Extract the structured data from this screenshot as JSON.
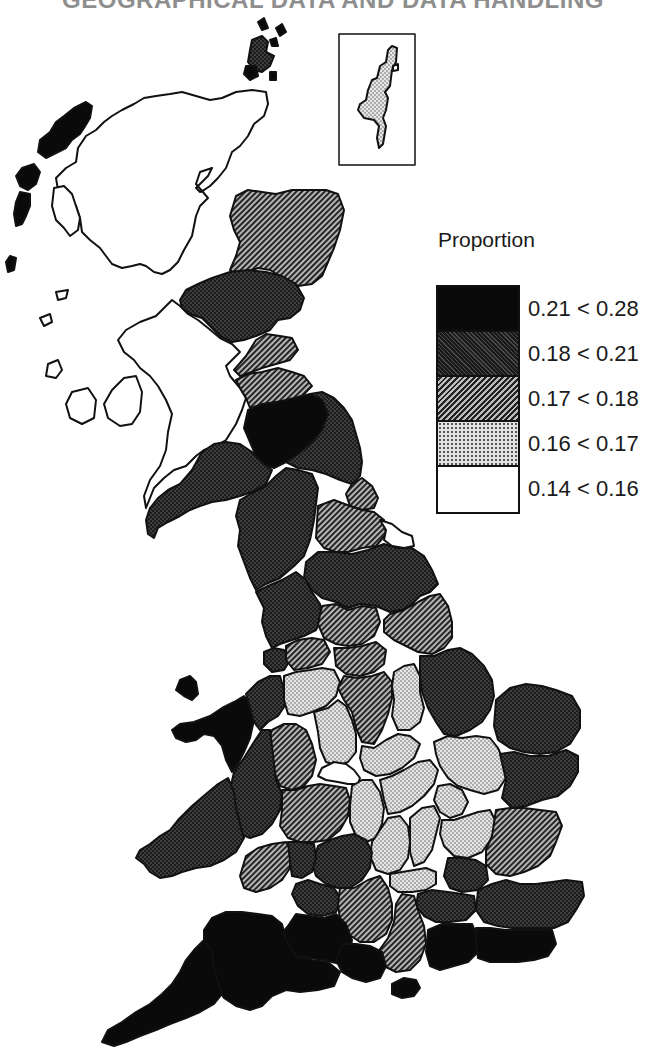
{
  "header": {
    "title": "GEOGRAPHICAL DATA AND DATA HANDLING"
  },
  "legend": {
    "title": "Proportion",
    "classes": [
      {
        "id": "c5",
        "label": "0.21 < 0.28",
        "min": 0.21,
        "max": 0.28,
        "fill": "black"
      },
      {
        "id": "c4",
        "label": "0.18 < 0.21",
        "min": 0.18,
        "max": 0.21,
        "fill": "dark-dotted"
      },
      {
        "id": "c3",
        "label": "0.17 < 0.18",
        "min": 0.17,
        "max": 0.18,
        "fill": "hatched"
      },
      {
        "id": "c2",
        "label": "0.16 < 0.17",
        "min": 0.16,
        "max": 0.17,
        "fill": "light-dotted"
      },
      {
        "id": "c1",
        "label": "0.14 < 0.16",
        "min": 0.14,
        "max": 0.16,
        "fill": "white"
      }
    ]
  },
  "map": {
    "subject": "Great Britain counties/regions choropleth",
    "inset": "Shetland Islands (boxed)",
    "regions": [
      {
        "name": "Shetland",
        "class": "c2"
      },
      {
        "name": "Orkney",
        "class": "c4"
      },
      {
        "name": "Western Isles",
        "class": "c5"
      },
      {
        "name": "Highland",
        "class": "c1"
      },
      {
        "name": "Grampian",
        "class": "c3"
      },
      {
        "name": "Tayside",
        "class": "c4"
      },
      {
        "name": "Fife",
        "class": "c3"
      },
      {
        "name": "Strathclyde",
        "class": "c1"
      },
      {
        "name": "Central",
        "class": "c1"
      },
      {
        "name": "Lothian",
        "class": "c3"
      },
      {
        "name": "Borders",
        "class": "c5"
      },
      {
        "name": "Dumfries and Galloway",
        "class": "c4"
      },
      {
        "name": "Northumberland",
        "class": "c4"
      },
      {
        "name": "Tyne and Wear",
        "class": "c3"
      },
      {
        "name": "Cumbria",
        "class": "c4"
      },
      {
        "name": "Durham",
        "class": "c4"
      },
      {
        "name": "Cleveland",
        "class": "c1"
      },
      {
        "name": "North Yorkshire",
        "class": "c4"
      },
      {
        "name": "Lancashire",
        "class": "c4"
      },
      {
        "name": "West Yorkshire",
        "class": "c3"
      },
      {
        "name": "Humberside",
        "class": "c3"
      },
      {
        "name": "Merseyside",
        "class": "c4"
      },
      {
        "name": "Greater Manchester",
        "class": "c3"
      },
      {
        "name": "South Yorkshire",
        "class": "c3"
      },
      {
        "name": "Lincolnshire",
        "class": "c4"
      },
      {
        "name": "Gwynedd",
        "class": "c5"
      },
      {
        "name": "Clwyd",
        "class": "c4"
      },
      {
        "name": "Cheshire",
        "class": "c2"
      },
      {
        "name": "Derbyshire",
        "class": "c3"
      },
      {
        "name": "Nottinghamshire",
        "class": "c2"
      },
      {
        "name": "Staffordshire",
        "class": "c2"
      },
      {
        "name": "Shropshire",
        "class": "c3"
      },
      {
        "name": "West Midlands",
        "class": "c1"
      },
      {
        "name": "Leicestershire",
        "class": "c2"
      },
      {
        "name": "Norfolk",
        "class": "c4"
      },
      {
        "name": "Cambridgeshire",
        "class": "c2"
      },
      {
        "name": "Suffolk",
        "class": "c4"
      },
      {
        "name": "Powys",
        "class": "c4"
      },
      {
        "name": "Dyfed",
        "class": "c4"
      },
      {
        "name": "Hereford and Worcester",
        "class": "c3"
      },
      {
        "name": "Warwickshire",
        "class": "c2"
      },
      {
        "name": "Northamptonshire",
        "class": "c2"
      },
      {
        "name": "Bedfordshire",
        "class": "c2"
      },
      {
        "name": "Buckinghamshire",
        "class": "c2"
      },
      {
        "name": "Oxfordshire",
        "class": "c2"
      },
      {
        "name": "Hertfordshire",
        "class": "c2"
      },
      {
        "name": "Essex",
        "class": "c3"
      },
      {
        "name": "Gloucestershire",
        "class": "c4"
      },
      {
        "name": "Glamorgan",
        "class": "c3"
      },
      {
        "name": "Gwent",
        "class": "c4"
      },
      {
        "name": "Avon",
        "class": "c4"
      },
      {
        "name": "Wiltshire",
        "class": "c3"
      },
      {
        "name": "Berkshire",
        "class": "c2"
      },
      {
        "name": "Greater London",
        "class": "c4"
      },
      {
        "name": "Surrey",
        "class": "c4"
      },
      {
        "name": "Kent",
        "class": "c4"
      },
      {
        "name": "Hampshire",
        "class": "c3"
      },
      {
        "name": "West Sussex",
        "class": "c5"
      },
      {
        "name": "East Sussex",
        "class": "c5"
      },
      {
        "name": "Isle of Wight",
        "class": "c5"
      },
      {
        "name": "Somerset",
        "class": "c5"
      },
      {
        "name": "Dorset",
        "class": "c5"
      },
      {
        "name": "Devon",
        "class": "c5"
      },
      {
        "name": "Cornwall",
        "class": "c5"
      }
    ]
  }
}
